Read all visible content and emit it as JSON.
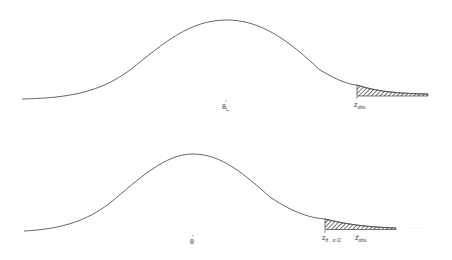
{
  "panels": [
    {
      "name": "top",
      "center_label": "θ",
      "center_subscript": "L",
      "tail_labels": [
        {
          "main": "z",
          "sub": "obs"
        }
      ]
    },
    {
      "name": "bottom",
      "center_label": "θ",
      "tail_labels": [
        {
          "main": "z",
          "sub": "θ , α /2"
        },
        {
          "main": "z",
          "sub": "obs"
        }
      ]
    }
  ],
  "colors": {
    "curve": "#555555",
    "hatch": "#333333"
  }
}
